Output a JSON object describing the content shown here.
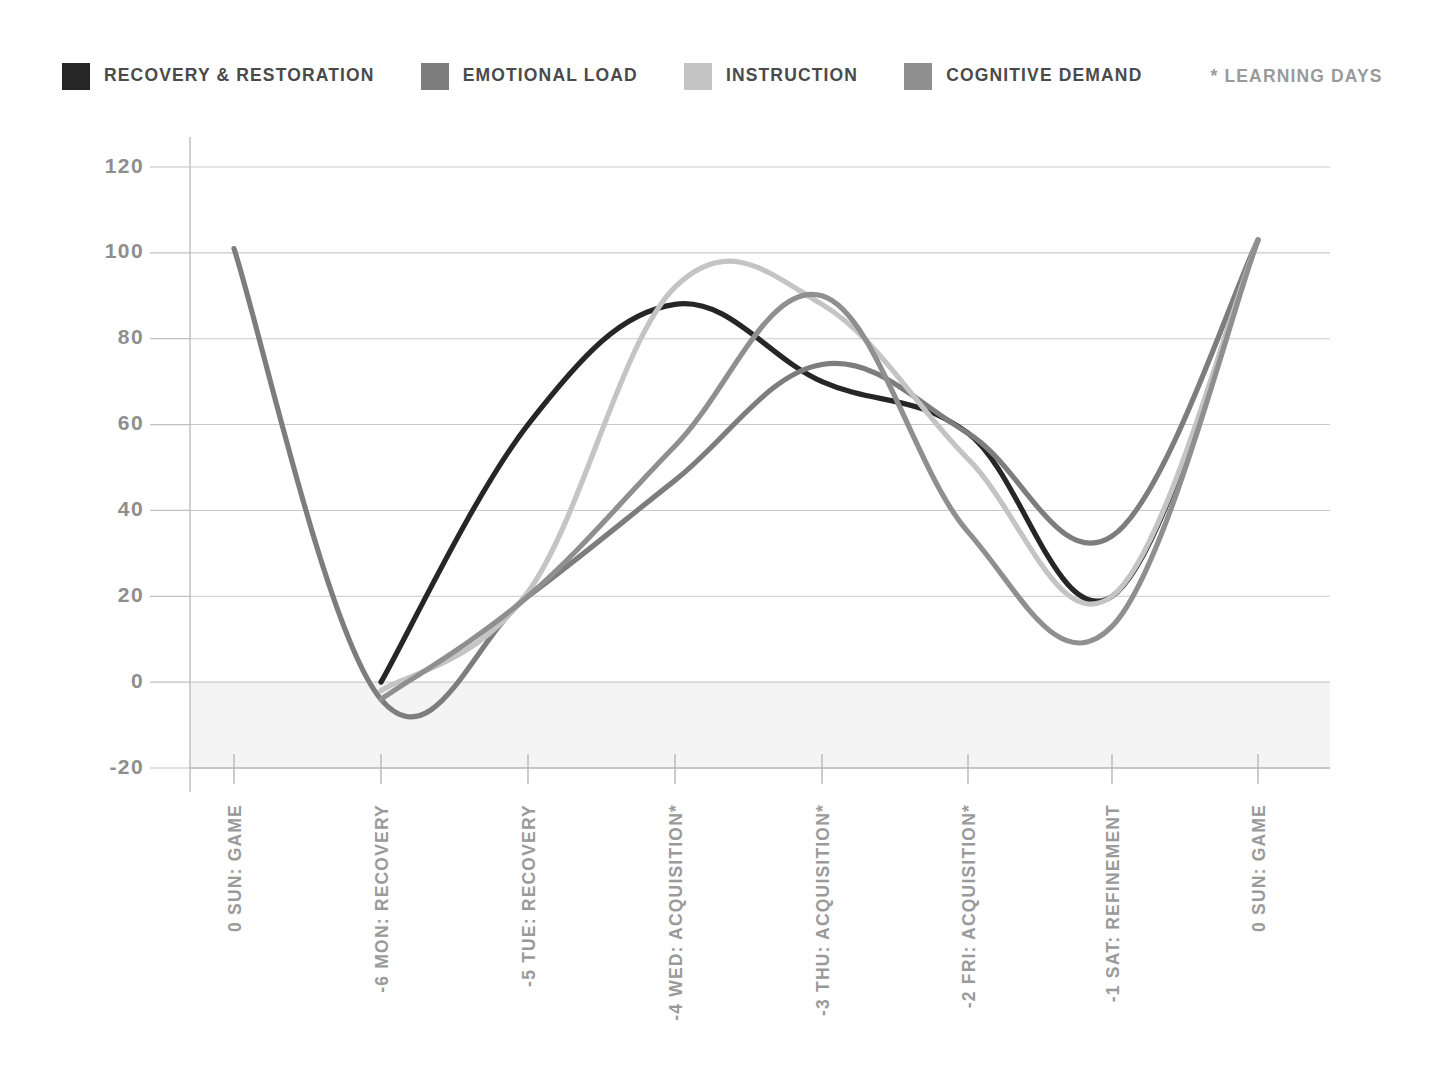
{
  "legend": {
    "items": [
      {
        "label": "RECOVERY & RESTORATION",
        "color": "#262626",
        "swatch_name": "legend-swatch-recovery"
      },
      {
        "label": "EMOTIONAL LOAD",
        "color": "#7d7d7d",
        "swatch_name": "legend-swatch-emotional-load"
      },
      {
        "label": "INSTRUCTION",
        "color": "#c4c4c4",
        "swatch_name": "legend-swatch-instruction"
      },
      {
        "label": "COGNITIVE DEMAND",
        "color": "#8f8f8f",
        "swatch_name": "legend-swatch-cognitive-demand"
      }
    ],
    "note": "* LEARNING DAYS"
  },
  "chart_data": {
    "type": "line",
    "title": "",
    "subtitle": "",
    "xlabel": "",
    "ylabel": "",
    "grid": true,
    "legend_position": "top-left",
    "ylim": [
      -20,
      120
    ],
    "yticks": [
      120,
      100,
      80,
      60,
      40,
      20,
      0,
      -20
    ],
    "ytick_labels": [
      "120",
      "100",
      "80",
      "60",
      "40",
      "20",
      "0",
      "-20"
    ],
    "categories": [
      "0 SUN: GAME",
      "-6 MON: RECOVERY",
      "-5 TUE: RECOVERY",
      "-4 WED: ACQUISITION*",
      "-3 THU: ACQUISITION*",
      "-2 FRI: ACQUISITION*",
      "-1 SAT: REFINEMENT",
      "0 SUN: GAME"
    ],
    "x": [
      0,
      1,
      2,
      3,
      4,
      5,
      6,
      7
    ],
    "series": [
      {
        "name": "RECOVERY & RESTORATION",
        "color": "#262626",
        "width": 5.2,
        "values": [
          null,
          0,
          60,
          88,
          70,
          58,
          20,
          103
        ],
        "note": "starts at MON (-6); peaks ~88 between WED and TUE; local plateau ~57 near THU; trough ~20 near FRI/SAT; rises to ~103 at final SUN"
      },
      {
        "name": "EMOTIONAL LOAD",
        "color": "#7d7d7d",
        "width": 5.2,
        "values": [
          101,
          -4,
          20,
          47,
          74,
          58,
          34,
          103
        ],
        "note": "starts 101 at SUN, plunges to -4 at MON, climbs steadily, crosses near 58 at FRI, down to ~34 at SAT, rises to 103"
      },
      {
        "name": "INSTRUCTION",
        "color": "#c4c4c4",
        "width": 5.2,
        "values": [
          null,
          -2,
          21,
          92,
          88,
          52,
          20,
          103
        ],
        "note": "starts MON near -2; peak ~92 just after WED; descends to ~20 trough near SAT; climbs to 103"
      },
      {
        "name": "COGNITIVE DEMAND",
        "color": "#8f8f8f",
        "width": 5.2,
        "values": [
          null,
          -4,
          20,
          55,
          90,
          35,
          13,
          103
        ],
        "note": "starts MON near -4; peak ~90 just before THU; deepest trough ~13 between FRI and SAT; rises to 103"
      }
    ]
  }
}
